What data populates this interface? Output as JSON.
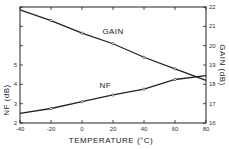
{
  "chart_data": {
    "type": "line",
    "title": "",
    "xlabel": "TEMPERATURE (°C)",
    "ylabel_left": "NF (dB)",
    "ylabel_right": "GAIN (dB)",
    "x": [
      -40,
      -20,
      0,
      20,
      40,
      60,
      80
    ],
    "xlim": [
      -40,
      80
    ],
    "xticks": [
      -40,
      -20,
      0,
      20,
      40,
      60,
      80
    ],
    "ylim_left": [
      2,
      8
    ],
    "yticks_left": [
      2,
      3,
      4,
      5,
      6,
      7,
      8
    ],
    "yticklabels_left": [
      "2",
      "3",
      "4",
      "5",
      "",
      "",
      ""
    ],
    "ylim_right": [
      16,
      22
    ],
    "yticks_right": [
      16,
      17,
      18,
      19,
      20,
      21,
      22
    ],
    "grid": false,
    "legend": "inline labels on curves",
    "series": [
      {
        "name": "GAIN",
        "axis": "right",
        "values": [
          21.85,
          21.3,
          20.65,
          20.1,
          19.4,
          18.8,
          18.2
        ],
        "marker": "open-circle",
        "label_at": {
          "x": 20,
          "y": 20.6
        }
      },
      {
        "name": "NF",
        "axis": "left",
        "values": [
          2.5,
          2.75,
          3.1,
          3.45,
          3.75,
          4.25,
          4.45
        ],
        "marker": "open-circle",
        "label_at": {
          "x": 15,
          "y": 3.8
        }
      }
    ]
  }
}
